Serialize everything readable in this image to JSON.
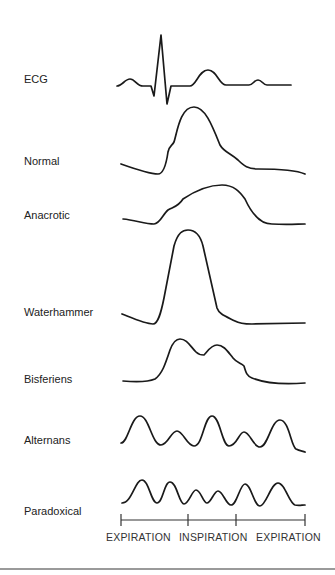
{
  "figure": {
    "traces": [
      {
        "key": "ecg",
        "label": "ECG"
      },
      {
        "key": "normal",
        "label": "Normal"
      },
      {
        "key": "anacrotic",
        "label": "Anacrotic"
      },
      {
        "key": "waterhammer",
        "label": "Waterhammer"
      },
      {
        "key": "bisferiens",
        "label": "Bisferiens"
      },
      {
        "key": "alternans",
        "label": "Alternans"
      },
      {
        "key": "paradoxical",
        "label": "Paradoxical"
      }
    ],
    "respiration_axis": {
      "phases": [
        "EXPIRATION",
        "INSPIRATION",
        "EXPIRATION"
      ]
    },
    "colors": {
      "trace": "#1a1a1a",
      "text": "#222222",
      "rule": "#9a9a9a"
    }
  }
}
